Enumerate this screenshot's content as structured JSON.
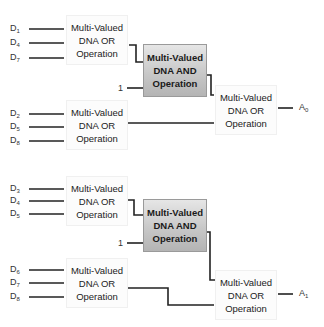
{
  "diagram": {
    "type": "multi-valued DNA logic circuit",
    "or_label_lines": [
      "Multi-Valued",
      "DNA OR",
      "Operation"
    ],
    "and_label_lines": [
      "Multi-Valued",
      "DNA AND",
      "Operation"
    ],
    "constant_input": "1",
    "circuits": [
      {
        "output": {
          "base": "A",
          "sub": "0"
        },
        "or_gate_1_inputs": [
          {
            "base": "D",
            "sub": "1"
          },
          {
            "base": "D",
            "sub": "4"
          },
          {
            "base": "D",
            "sub": "7"
          }
        ],
        "or_gate_2_inputs": [
          {
            "base": "D",
            "sub": "2"
          },
          {
            "base": "D",
            "sub": "5"
          },
          {
            "base": "D",
            "sub": "8"
          }
        ]
      },
      {
        "output": {
          "base": "A",
          "sub": "1"
        },
        "or_gate_1_inputs": [
          {
            "base": "D",
            "sub": "3"
          },
          {
            "base": "D",
            "sub": "4"
          },
          {
            "base": "D",
            "sub": "5"
          }
        ],
        "or_gate_2_inputs": [
          {
            "base": "D",
            "sub": "6"
          },
          {
            "base": "D",
            "sub": "7"
          },
          {
            "base": "D",
            "sub": "8"
          }
        ]
      }
    ],
    "colors": {
      "wire": "#222222",
      "or_box_fill": "#fcfcfc",
      "and_box_fill_top": "#e6e6e6",
      "and_box_fill_bottom": "#b4b4b4"
    }
  }
}
